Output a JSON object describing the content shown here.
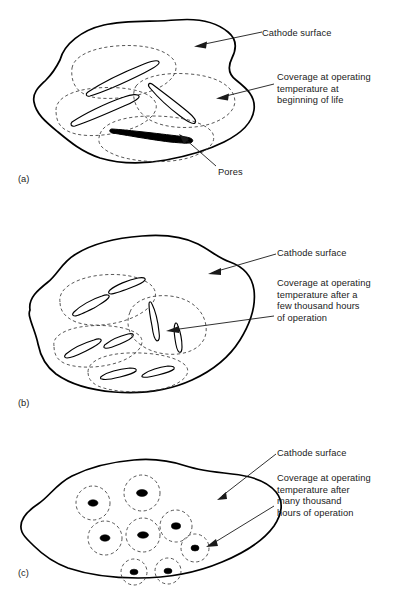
{
  "panels": [
    {
      "tag": "(a)",
      "labels": {
        "cathode_surface": "Cathode surface",
        "coverage": "Coverage at operating\ntemperature at\nbeginning of life",
        "pores": "Pores"
      }
    },
    {
      "tag": "(b)",
      "labels": {
        "cathode_surface": "Cathode surface",
        "coverage": "Coverage at operating\ntemperature after a\nfew thousand hours\nof operation"
      }
    },
    {
      "tag": "(c)",
      "labels": {
        "cathode_surface": "Cathode surface",
        "coverage": "Coverage at operating\ntemperature after\nmany thousand\nhours of operation"
      }
    }
  ],
  "style": {
    "outline_color": "#000000",
    "coverage_color": "#3a3a3a",
    "pore_color": "#000000",
    "background": "#ffffff"
  }
}
